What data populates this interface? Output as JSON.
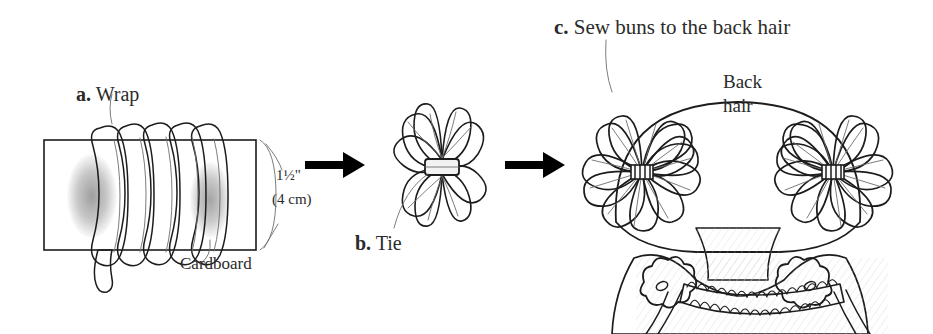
{
  "figure": {
    "background_color": "#ffffff",
    "ink_color": "#1c1c1c",
    "shade_color": "#d9d9d9"
  },
  "steps": [
    {
      "id": "a",
      "marker": "a.",
      "label": "Wrap",
      "annotations": {
        "material": "Cardboard",
        "measure_imperial": "1½\"",
        "measure_metric": "(4 cm)"
      }
    },
    {
      "id": "b",
      "marker": "b.",
      "label": "Tie"
    },
    {
      "id": "c",
      "marker": "c.",
      "label": "Sew buns to the back hair",
      "annotations": {
        "hair_label_line1": "Back",
        "hair_label_line2": "hair"
      }
    }
  ],
  "arrows": [
    {
      "name": "arrow-a-to-b",
      "direction": "right"
    },
    {
      "name": "arrow-b-to-c",
      "direction": "right"
    }
  ],
  "counts": {
    "yarn_wraps": 6,
    "bun_petals": 12,
    "buns_on_head": 2,
    "flower_buttons": 2
  }
}
